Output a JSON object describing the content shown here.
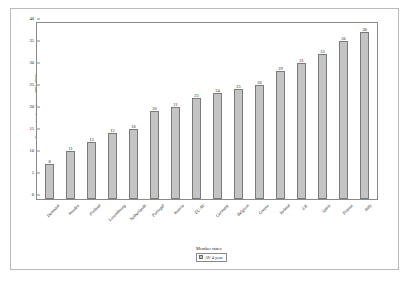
{
  "chart_data": {
    "type": "bar",
    "title": "",
    "subtitle": "",
    "xlabel": "",
    "ylabel": "Average number of cases 2001-2004",
    "ylim": [
      0,
      40
    ],
    "y_ticks": [
      0,
      5,
      10,
      15,
      20,
      25,
      30,
      35,
      40
    ],
    "grid": false,
    "legend_position": "bottom-center",
    "legend_title": "Member states",
    "categories": [
      "Denmark",
      "Sweden",
      "Finland",
      "Luxembourg",
      "Netherlands",
      "Portugal",
      "Austria",
      "EU AV",
      "Germany",
      "Belgium",
      "Greece",
      "Ireland",
      "UK",
      "Spain",
      "France",
      "Italy"
    ],
    "series": [
      {
        "name": "AV 4 year",
        "color": "#c4c4c4",
        "values": [
          8,
          11,
          13,
          15,
          16,
          20,
          21,
          23,
          24,
          25,
          26,
          29,
          31,
          33,
          36,
          38
        ]
      }
    ]
  },
  "colors": {
    "bar_fill": "#c4c4c4",
    "bar_border": "#7a7a7a",
    "axis": "#8a8a8a",
    "frame": "#b9b9b9",
    "text": "#1a1a1a",
    "background": "#ffffff"
  }
}
